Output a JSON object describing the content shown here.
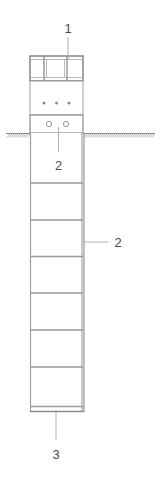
{
  "figure": {
    "type": "patent-line-drawing",
    "background_color": "#ffffff",
    "line_color": "#8c8c8c",
    "line_color_dark": "#6e6e6e",
    "text_color": "#4a4a4a"
  },
  "callouts": {
    "top": {
      "label": "1",
      "name": "callout-1-top-cap"
    },
    "middle": {
      "label": "2",
      "name": "callout-2-below-grade"
    },
    "right": {
      "label": "2",
      "name": "callout-2-shaft-right"
    },
    "bottom": {
      "label": "3",
      "name": "callout-3-base"
    }
  },
  "geometry": {
    "column": {
      "left_x": 30,
      "right_x": 83,
      "top_y": 56,
      "bottom_y": 412
    },
    "top_cap": {
      "top_y": 56,
      "bottom_y": 81,
      "openings": 3,
      "divider_x": [
        47,
        65
      ]
    },
    "upper_body": {
      "top_y": 81,
      "bottom_y": 115
    },
    "collar": {
      "top_y": 115,
      "bottom_y": 133
    },
    "ground_line": {
      "y": 133,
      "left_start": 6,
      "left_end": 30,
      "right_start": 83,
      "right_end": 155,
      "hatch_count_left": 12,
      "hatch_count_right": 30
    },
    "dots": {
      "count": 3,
      "y": 103,
      "x": [
        44,
        56,
        69
      ],
      "radius": 1.4
    },
    "circles": {
      "count": 2,
      "y": 124,
      "x": [
        49,
        66
      ],
      "radius": 2.6
    },
    "shaft_bands_y": [
      183,
      220,
      256,
      293,
      330,
      367,
      404
    ]
  }
}
